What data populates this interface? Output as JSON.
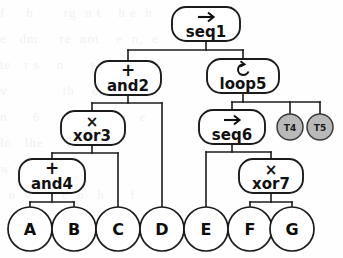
{
  "figure": {
    "kind": "operator-tree-diagram",
    "background_color": "#fefefe",
    "line_color": "#1b1b1b",
    "task_fill_color": "#b9b9b9",
    "leaf_fill_color": "#ffffff"
  },
  "nodes": {
    "seq1": {
      "label": "seq1",
      "symbol": "arrow-right",
      "type": "operator",
      "x": 206,
      "y": 24
    },
    "and2": {
      "label": "and2",
      "symbol": "plus",
      "type": "operator",
      "x": 128,
      "y": 78
    },
    "loop5": {
      "label": "loop5",
      "symbol": "loop",
      "type": "operator",
      "x": 243,
      "y": 76
    },
    "xor3": {
      "label": "xor3",
      "symbol": "times",
      "type": "operator",
      "x": 92,
      "y": 128
    },
    "seq6": {
      "label": "seq6",
      "symbol": "arrow-right",
      "type": "operator",
      "x": 232,
      "y": 127
    },
    "and4": {
      "label": "and4",
      "symbol": "plus",
      "type": "operator",
      "x": 52,
      "y": 176
    },
    "xor7": {
      "label": "xor7",
      "symbol": "times",
      "type": "operator",
      "x": 271,
      "y": 176
    },
    "t4": {
      "label": "T4",
      "type": "task",
      "x": 290,
      "y": 127
    },
    "t5": {
      "label": "T5",
      "type": "task",
      "x": 320,
      "y": 127
    },
    "a": {
      "label": "A",
      "type": "leaf",
      "x": 30,
      "y": 229
    },
    "b": {
      "label": "B",
      "type": "leaf",
      "x": 74,
      "y": 229
    },
    "c": {
      "label": "C",
      "type": "leaf",
      "x": 118,
      "y": 229
    },
    "d": {
      "label": "D",
      "type": "leaf",
      "x": 162,
      "y": 229
    },
    "e": {
      "label": "E",
      "type": "leaf",
      "x": 206,
      "y": 229
    },
    "f": {
      "label": "F",
      "type": "leaf",
      "x": 250,
      "y": 229
    },
    "g": {
      "label": "G",
      "type": "leaf",
      "x": 292,
      "y": 229
    }
  },
  "edges": [
    {
      "from": "seq1",
      "to": "and2"
    },
    {
      "from": "seq1",
      "to": "loop5"
    },
    {
      "from": "and2",
      "to": "xor3"
    },
    {
      "from": "and2",
      "to": "d"
    },
    {
      "from": "xor3",
      "to": "and4"
    },
    {
      "from": "xor3",
      "to": "c"
    },
    {
      "from": "and4",
      "to": "a"
    },
    {
      "from": "and4",
      "to": "b"
    },
    {
      "from": "loop5",
      "to": "seq6"
    },
    {
      "from": "loop5",
      "to": "t4"
    },
    {
      "from": "loop5",
      "to": "t5"
    },
    {
      "from": "seq6",
      "to": "e"
    },
    {
      "from": "seq6",
      "to": "xor7"
    },
    {
      "from": "xor7",
      "to": "f"
    },
    {
      "from": "xor7",
      "to": "g"
    }
  ],
  "symbols": {
    "arrow-right": "→",
    "plus": "+",
    "times": "×",
    "loop": "↺"
  },
  "background_text": {
    "line1": "f     h       rg  n t    h e  h  ",
    "line2": "e   dm     re  not    e  n,  e ",
    "line3": "te   r s    n      t    r  ne   h",
    "line4": "v             th    eose",
    "line5": "n      6       8   n     n   e",
    "line6": "lo   lhe     We                ",
    "line7": "w    h    h  m                 ",
    "line8": "  n  v       e  n   h      f   "
  }
}
